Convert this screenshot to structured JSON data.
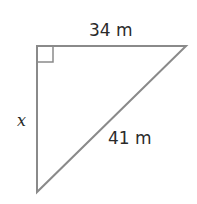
{
  "diagram": {
    "type": "right-triangle",
    "labels": {
      "top_side": "34 m",
      "left_side": "x",
      "hypotenuse": "41 m"
    },
    "right_angle_marker": true,
    "stroke_color": "#8a8a8a"
  }
}
